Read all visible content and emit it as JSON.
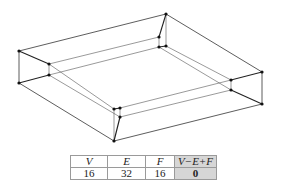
{
  "figure": {
    "vertices": {
      "A": [
        19,
        51
      ],
      "B": [
        19,
        83
      ],
      "C": [
        49,
        64
      ],
      "D": [
        49,
        75
      ],
      "E": [
        166,
        14
      ],
      "F": [
        159,
        37
      ],
      "G": [
        159,
        47
      ],
      "H": [
        166,
        46
      ],
      "I": [
        262,
        72
      ],
      "J": [
        262,
        104
      ],
      "K": [
        231,
        80
      ],
      "L": [
        231,
        90
      ],
      "M": [
        114,
        109
      ],
      "N": [
        120,
        108
      ],
      "O": [
        120,
        117
      ],
      "P": [
        114,
        141
      ]
    },
    "edge_color": "#333333",
    "vertex_color": "#111111"
  },
  "table": {
    "headers": [
      "V",
      "E",
      "F",
      "V−E+F"
    ],
    "values": [
      "16",
      "32",
      "16",
      "0"
    ],
    "highlight_color": "#d6d6d6"
  }
}
